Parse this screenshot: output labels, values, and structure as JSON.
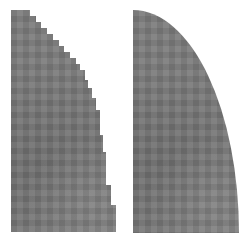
{
  "figure": {
    "panels": [
      {
        "id": "left",
        "label": "aliased-quarter-shape",
        "fill": "#7d7d7d",
        "edge": "jagged staircase"
      },
      {
        "id": "right",
        "label": "antialiased-quarter-shape",
        "fill": "#7d7d7d",
        "edge": "smooth anti-aliased"
      }
    ],
    "background": "#ffffff"
  }
}
